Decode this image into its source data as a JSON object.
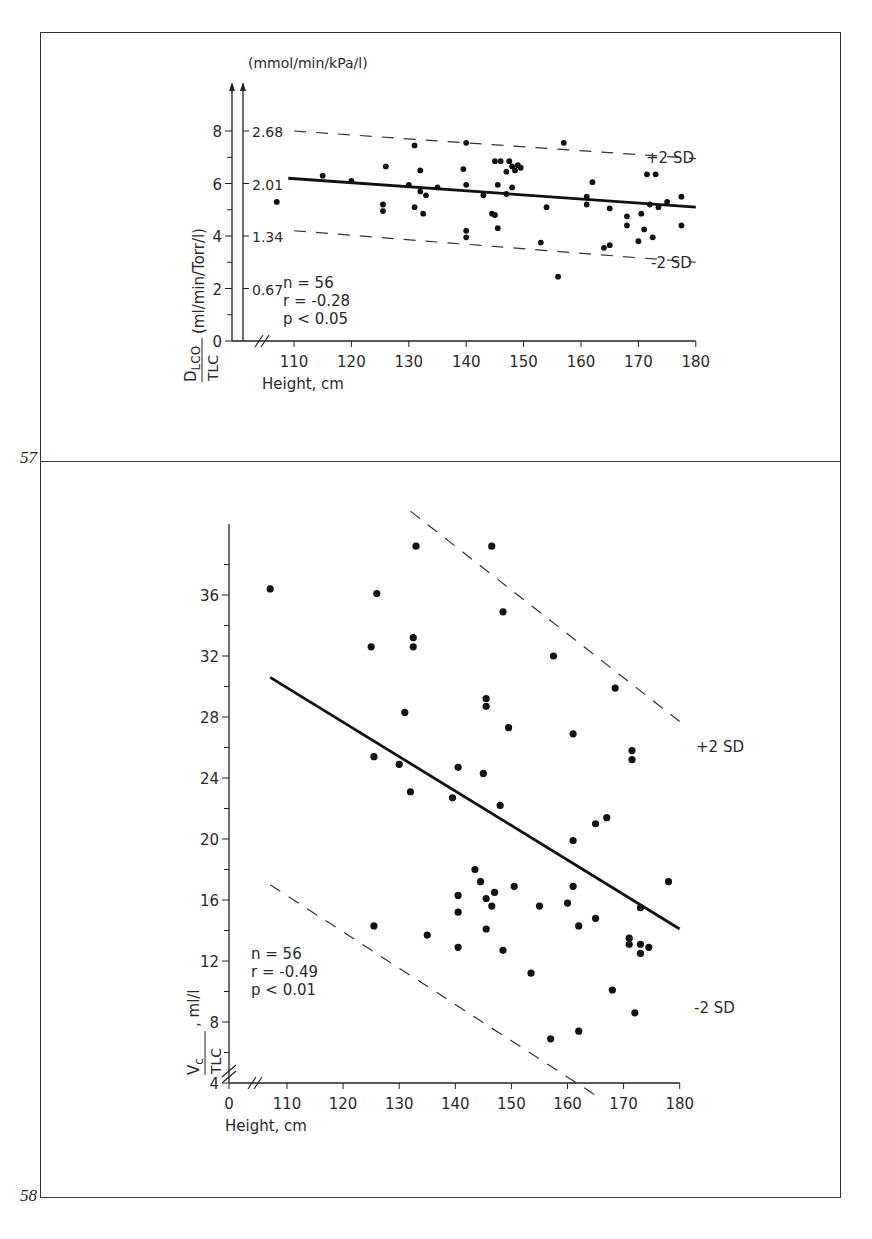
{
  "figures": [
    {
      "number": "57"
    },
    {
      "number": "58"
    }
  ],
  "chart_data": [
    {
      "type": "scatter",
      "figure": "57",
      "xlabel": "Height, cm",
      "ylabel": "D_LCO / TLC (ml/min/Torr/l)",
      "ylabel_numerator": "D",
      "ylabel_subscript": "LCO",
      "ylabel_denominator": "TLC",
      "ylabel_units": "(ml/min/Torr/l)",
      "secondary_ylabel": "(mmol/min/kPa/l)",
      "xlim": [
        103,
        180
      ],
      "ylim": [
        0,
        8
      ],
      "x_ticks": [
        110,
        120,
        130,
        140,
        150,
        160,
        170,
        180
      ],
      "y_ticks": [
        0,
        2,
        4,
        6,
        8
      ],
      "y_minor_step": 1,
      "secondary_y_ticks": [
        {
          "at": 2,
          "label": "0.67"
        },
        {
          "at": 4,
          "label": "1.34"
        },
        {
          "at": 6,
          "label": "2.01"
        },
        {
          "at": 8,
          "label": "2.68"
        }
      ],
      "axis_break_x": true,
      "stats": {
        "n": "n = 56",
        "r": "r = -0.28",
        "p": "p < 0.05"
      },
      "regression": {
        "x": [
          109,
          180
        ],
        "y": [
          6.2,
          5.1
        ],
        "style": "solid"
      },
      "bands": [
        {
          "label": "+2 SD",
          "x": [
            110,
            180
          ],
          "y": [
            8.0,
            6.95
          ],
          "style": "dashed"
        },
        {
          "label": "-2 SD",
          "x": [
            110,
            180
          ],
          "y": [
            4.2,
            3.0
          ],
          "style": "dashed"
        }
      ],
      "points": [
        [
          107,
          5.3
        ],
        [
          115,
          6.3
        ],
        [
          120,
          6.1
        ],
        [
          125.5,
          5.2
        ],
        [
          125.5,
          4.95
        ],
        [
          126,
          6.65
        ],
        [
          130,
          5.95
        ],
        [
          131,
          7.45
        ],
        [
          131,
          5.1
        ],
        [
          132,
          6.5
        ],
        [
          132,
          5.7
        ],
        [
          132.5,
          4.85
        ],
        [
          133,
          5.55
        ],
        [
          135,
          5.85
        ],
        [
          139.5,
          6.55
        ],
        [
          140,
          7.55
        ],
        [
          140,
          5.95
        ],
        [
          140,
          4.2
        ],
        [
          140,
          3.95
        ],
        [
          143,
          5.55
        ],
        [
          144.5,
          4.85
        ],
        [
          145,
          6.85
        ],
        [
          145,
          4.8
        ],
        [
          145.5,
          5.95
        ],
        [
          145.5,
          4.3
        ],
        [
          146,
          6.85
        ],
        [
          147,
          6.45
        ],
        [
          147,
          5.6
        ],
        [
          147.5,
          6.85
        ],
        [
          148,
          6.65
        ],
        [
          148,
          5.85
        ],
        [
          148.5,
          6.5
        ],
        [
          149,
          6.7
        ],
        [
          149.5,
          6.6
        ],
        [
          153,
          3.75
        ],
        [
          154,
          5.1
        ],
        [
          156,
          2.45
        ],
        [
          157,
          7.55
        ],
        [
          161,
          5.5
        ],
        [
          161,
          5.2
        ],
        [
          162,
          6.05
        ],
        [
          164,
          3.55
        ],
        [
          165,
          3.65
        ],
        [
          165,
          5.05
        ],
        [
          168,
          4.75
        ],
        [
          168,
          4.4
        ],
        [
          170,
          3.8
        ],
        [
          170.5,
          4.85
        ],
        [
          171,
          4.25
        ],
        [
          171.5,
          6.35
        ],
        [
          172,
          5.2
        ],
        [
          172.5,
          3.95
        ],
        [
          173,
          6.35
        ],
        [
          173.5,
          5.1
        ],
        [
          175,
          5.3
        ],
        [
          177.5,
          5.5
        ],
        [
          177.5,
          4.4
        ]
      ]
    },
    {
      "type": "scatter",
      "figure": "58",
      "xlabel": "Height, cm",
      "ylabel": "Vc / TLC, ml/l",
      "ylabel_numerator": "V",
      "ylabel_subscript": "c",
      "ylabel_denominator": "TLC",
      "ylabel_units": ", ml/l",
      "xlim": [
        100,
        180
      ],
      "ylim": [
        4,
        40
      ],
      "x_ticks": [
        110,
        120,
        130,
        140,
        150,
        160,
        170,
        180
      ],
      "x_tick_labels": [
        "0",
        "110",
        "120",
        "130",
        "140",
        "150",
        "160",
        "170",
        "180"
      ],
      "y_ticks": [
        4,
        8,
        12,
        16,
        20,
        24,
        28,
        32,
        36
      ],
      "y_minor_step": 2,
      "axis_break_x": true,
      "axis_break_y": true,
      "stats": {
        "n": "n = 56",
        "r": "r = -0.49",
        "p": "p < 0.01"
      },
      "regression": {
        "x": [
          107,
          180
        ],
        "y": [
          30.6,
          14.1
        ],
        "style": "solid"
      },
      "bands": [
        {
          "label": "+2 SD",
          "x": [
            132,
            180
          ],
          "y": [
            41.5,
            27.7
          ],
          "style": "dashed"
        },
        {
          "label": "-2 SD",
          "x": [
            107,
            165
          ],
          "y": [
            17.0,
            3.2
          ],
          "style": "dashed"
        }
      ],
      "points": [
        [
          107,
          36.4
        ],
        [
          125,
          32.6
        ],
        [
          125.5,
          25.4
        ],
        [
          125.5,
          14.3
        ],
        [
          126,
          36.1
        ],
        [
          130,
          24.9
        ],
        [
          131,
          28.3
        ],
        [
          132,
          23.1
        ],
        [
          132.5,
          32.6
        ],
        [
          132.5,
          33.2
        ],
        [
          133,
          39.2
        ],
        [
          135,
          13.7
        ],
        [
          139.5,
          22.7
        ],
        [
          140.5,
          24.7
        ],
        [
          140.5,
          16.3
        ],
        [
          140.5,
          15.2
        ],
        [
          140.5,
          12.9
        ],
        [
          143.5,
          18.0
        ],
        [
          144.5,
          17.2
        ],
        [
          145,
          24.3
        ],
        [
          145.5,
          29.2
        ],
        [
          145.5,
          28.7
        ],
        [
          145.5,
          16.1
        ],
        [
          145.5,
          14.1
        ],
        [
          146.5,
          15.6
        ],
        [
          146.5,
          39.2
        ],
        [
          147,
          16.5
        ],
        [
          148,
          22.2
        ],
        [
          148.5,
          12.7
        ],
        [
          148.5,
          34.9
        ],
        [
          149.5,
          27.3
        ],
        [
          150.5,
          16.9
        ],
        [
          153.5,
          11.2
        ],
        [
          155,
          15.6
        ],
        [
          157,
          6.9
        ],
        [
          157.5,
          32.0
        ],
        [
          160,
          15.8
        ],
        [
          161,
          26.9
        ],
        [
          161,
          16.9
        ],
        [
          161,
          19.9
        ],
        [
          162,
          14.3
        ],
        [
          162,
          7.4
        ],
        [
          165,
          14.8
        ],
        [
          165,
          21.0
        ],
        [
          167,
          21.4
        ],
        [
          168,
          10.1
        ],
        [
          168.5,
          29.9
        ],
        [
          171,
          13.5
        ],
        [
          171,
          13.1
        ],
        [
          171.5,
          25.8
        ],
        [
          171.5,
          25.2
        ],
        [
          172,
          8.6
        ],
        [
          173,
          15.5
        ],
        [
          173,
          13.1
        ],
        [
          173,
          12.5
        ],
        [
          174.5,
          12.9
        ],
        [
          178,
          17.2
        ]
      ]
    }
  ]
}
